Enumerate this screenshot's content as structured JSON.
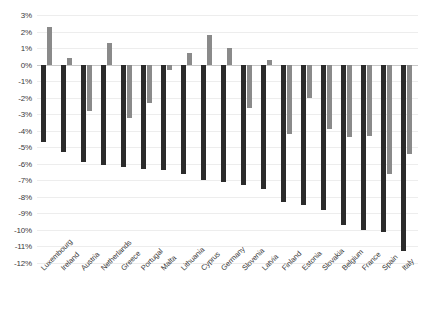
{
  "chart_data": {
    "type": "bar",
    "title": "",
    "subtitle": "",
    "xlabel": "",
    "ylabel": "",
    "ylim": [
      -12,
      3
    ],
    "ytick_step": 1,
    "grid": true,
    "legend": "none",
    "orientation": "vertical",
    "colors": {
      "series_light": "#8a8a8a",
      "series_dark": "#2b2b2b",
      "gridline": "#ededed",
      "zero_line": "#c9c9c9",
      "text": "#3a3a3a",
      "background": "#ffffff"
    },
    "ytick_labels": [
      "3%",
      "2%",
      "1%",
      "0%",
      "-1%",
      "-2%",
      "-3%",
      "-4%",
      "-5%",
      "-6%",
      "-7%",
      "-8%",
      "-9%",
      "-10%",
      "-11%",
      "-12%"
    ],
    "ytick_values": [
      3,
      2,
      1,
      0,
      -1,
      -2,
      -3,
      -4,
      -5,
      -6,
      -7,
      -8,
      -9,
      -10,
      -11,
      -12
    ],
    "categories": [
      "Luxembourg",
      "Ireland",
      "Austria",
      "Netherlands",
      "Greece",
      "Portugal",
      "Malta",
      "Lithuania",
      "Cyprus",
      "Germany",
      "Slovenia",
      "Latvia",
      "Finland",
      "Estonia",
      "Slovakia",
      "Belgium",
      "France",
      "Spain",
      "Italy"
    ],
    "series": [
      {
        "name": "series-dark",
        "color": "#2b2b2b",
        "values": [
          -4.7,
          -5.3,
          -5.9,
          -6.1,
          -6.2,
          -6.3,
          -6.4,
          -6.6,
          -7.0,
          -7.1,
          -7.3,
          -7.5,
          -8.3,
          -8.5,
          -8.8,
          -9.7,
          -10.0,
          -10.1,
          -11.3
        ]
      },
      {
        "name": "series-light",
        "color": "#8a8a8a",
        "values": [
          2.3,
          0.4,
          -2.8,
          1.3,
          -3.2,
          -2.3,
          -0.3,
          0.7,
          1.8,
          1.0,
          -2.6,
          0.3,
          -4.2,
          -2.0,
          -3.9,
          -4.4,
          -4.3,
          -6.6,
          -5.4
        ]
      }
    ]
  }
}
